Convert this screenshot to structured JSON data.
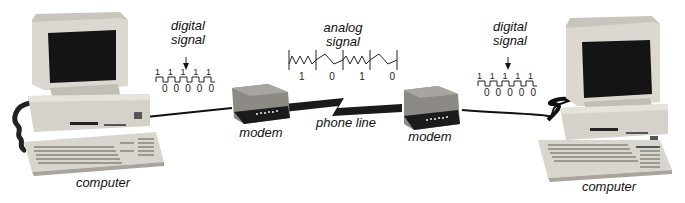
{
  "diagram": {
    "left_computer": {
      "label": "computer"
    },
    "right_computer": {
      "label": "computer"
    },
    "left_modem": {
      "label": "modem"
    },
    "right_modem": {
      "label": "modem"
    },
    "phone_line": {
      "label": "phone line"
    },
    "left_digital_signal": {
      "label_line1": "digital",
      "label_line2": "signal",
      "top_bits": [
        "1",
        "1",
        "1",
        "1",
        "1"
      ],
      "bottom_bits": [
        "0",
        "0",
        "0",
        "0",
        "0"
      ]
    },
    "right_digital_signal": {
      "label_line1": "digital",
      "label_line2": "signal",
      "top_bits": [
        "1",
        "1",
        "1",
        "1",
        "1"
      ],
      "bottom_bits": [
        "0",
        "0",
        "0",
        "0",
        "0"
      ]
    },
    "analog_signal": {
      "label_line1": "analog",
      "label_line2": "signal",
      "bits": [
        "1",
        "0",
        "1",
        "0"
      ]
    },
    "colors": {
      "computer_body": "#d8d3cc",
      "computer_shadow": "#a9a49d",
      "screen": "#141414",
      "modem_body": "#8a8783",
      "modem_front": "#1b1b1b",
      "cable": "#111111",
      "text": "#111111"
    }
  }
}
